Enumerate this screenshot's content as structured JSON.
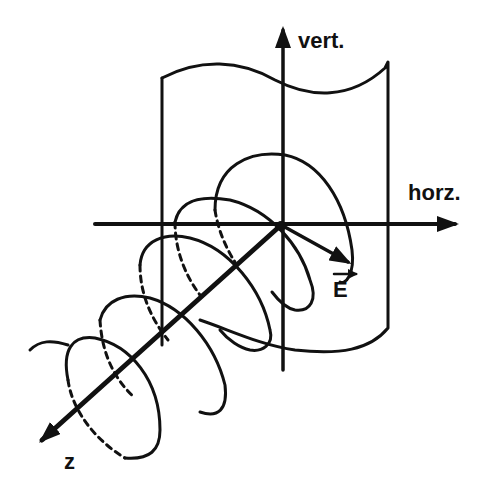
{
  "diagram": {
    "labels": {
      "vertical_axis": "vert.",
      "horizontal_axis": "horz.",
      "field_vector": "E",
      "propagation_axis": "z"
    },
    "ink_color": "#111111",
    "background_color": "#ffffff",
    "helix": {
      "turns_visible": 5,
      "hidden_segments_style": "dashed"
    }
  }
}
